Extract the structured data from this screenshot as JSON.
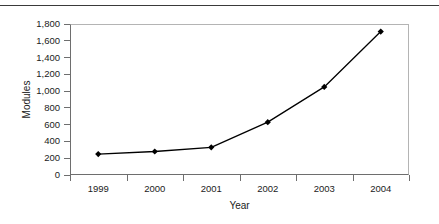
{
  "chart_data": {
    "type": "line",
    "title": "",
    "xlabel": "Year",
    "ylabel": "Modules",
    "categories": [
      "1999",
      "2000",
      "2001",
      "2002",
      "2003",
      "2004"
    ],
    "series": [
      {
        "name": "Modules",
        "values": [
          250,
          280,
          330,
          630,
          1050,
          1710
        ]
      }
    ],
    "ylim": [
      0,
      1800
    ],
    "y_ticks": [
      0,
      200,
      400,
      600,
      800,
      1000,
      1200,
      1400,
      1600,
      1800
    ],
    "y_tick_labels": [
      "0",
      "200",
      "400",
      "600",
      "800",
      "1,000",
      "1,200",
      "1,400",
      "1,600",
      "1,800"
    ],
    "grid": false,
    "legend": false,
    "marker": "diamond",
    "line_color": "#000000",
    "marker_color": "#000000",
    "axis_color": "#6e6e6e",
    "frame_color": "#b4b4b4",
    "text_color": "#1b1b1b"
  }
}
